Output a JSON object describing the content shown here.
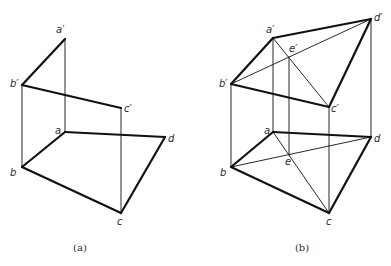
{
  "figures": [
    {
      "id": "a",
      "caption": "(a)",
      "caption_pos": [
        80,
        251
      ],
      "points": {
        "a'": [
          65,
          39
        ],
        "b'": [
          22,
          85
        ],
        "c'": [
          121,
          108
        ],
        "a": [
          65,
          132
        ],
        "b": [
          22,
          167
        ],
        "c": [
          121,
          213
        ],
        "d": [
          165,
          137
        ]
      },
      "labels": [
        {
          "text": "a′",
          "pos": [
            56,
            33
          ]
        },
        {
          "text": "b′",
          "pos": [
            10,
            87
          ]
        },
        {
          "text": "c′",
          "pos": [
            124,
            112
          ]
        },
        {
          "text": "a",
          "pos": [
            55,
            134
          ]
        },
        {
          "text": "b",
          "pos": [
            10,
            176
          ]
        },
        {
          "text": "c",
          "pos": [
            117,
            225
          ]
        },
        {
          "text": "d",
          "pos": [
            168,
            142
          ]
        }
      ],
      "thick_edges": [
        [
          "a'",
          "b'"
        ],
        [
          "b'",
          "c'"
        ],
        [
          "a",
          "b"
        ],
        [
          "b",
          "c"
        ],
        [
          "c",
          "d"
        ],
        [
          "a",
          "d"
        ]
      ],
      "thin_edges": [
        [
          "a'",
          "a"
        ],
        [
          "b'",
          "b"
        ],
        [
          "c'",
          "c"
        ]
      ]
    },
    {
      "id": "b",
      "caption": "(b)",
      "caption_pos": [
        302,
        251
      ],
      "points": {
        "a'": [
          273,
          38
        ],
        "b'": [
          231,
          84
        ],
        "c'": [
          329,
          107
        ],
        "d'": [
          371,
          19
        ],
        "e'": [
          289,
          57
        ],
        "a": [
          273,
          132
        ],
        "b": [
          231,
          167
        ],
        "c": [
          329,
          213
        ],
        "d": [
          371,
          137
        ],
        "e": [
          289,
          155
        ]
      },
      "labels": [
        {
          "text": "a′",
          "pos": [
            266,
            33
          ]
        },
        {
          "text": "b′",
          "pos": [
            219,
            87
          ]
        },
        {
          "text": "c′",
          "pos": [
            331,
            112
          ]
        },
        {
          "text": "d′",
          "pos": [
            374,
            21
          ]
        },
        {
          "text": "e′",
          "pos": [
            289,
            52
          ]
        },
        {
          "text": "a",
          "pos": [
            264,
            134
          ]
        },
        {
          "text": "b",
          "pos": [
            220,
            176
          ]
        },
        {
          "text": "c",
          "pos": [
            326,
            225
          ]
        },
        {
          "text": "d",
          "pos": [
            374,
            142
          ]
        },
        {
          "text": "e",
          "pos": [
            285,
            165
          ]
        }
      ],
      "thick_edges": [
        [
          "a'",
          "b'"
        ],
        [
          "b'",
          "c'"
        ],
        [
          "c'",
          "d'"
        ],
        [
          "a'",
          "d'"
        ],
        [
          "a",
          "b"
        ],
        [
          "b",
          "c"
        ],
        [
          "c",
          "d"
        ],
        [
          "a",
          "d"
        ]
      ],
      "thin_edges": [
        [
          "a'",
          "c'"
        ],
        [
          "b'",
          "d'"
        ],
        [
          "a",
          "c"
        ],
        [
          "b",
          "d"
        ],
        [
          "a'",
          "a"
        ],
        [
          "b'",
          "b"
        ],
        [
          "c'",
          "c"
        ],
        [
          "d'",
          "d"
        ],
        [
          "e'",
          "e"
        ]
      ]
    }
  ],
  "style": {
    "line_color": "#111111",
    "thick_width": 2.2,
    "thin_width": 0.9
  }
}
